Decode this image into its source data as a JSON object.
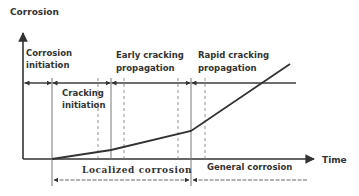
{
  "diagram": {
    "y_axis_label": "Corrosion",
    "x_axis_label": "Time",
    "stages": {
      "corrosion_initiation": [
        "Corrosion",
        "initiation"
      ],
      "cracking_initiation": [
        "Cracking",
        "initiation"
      ],
      "early_cracking_propagation": [
        "Early cracking",
        "propagation"
      ],
      "rapid_cracking_propagation": [
        "Rapid cracking",
        "propagation"
      ]
    },
    "regions": {
      "localized": "Localized corrosion",
      "general": "General corrosion"
    },
    "colors": {
      "line": "#333333",
      "guide": "#777777",
      "text": "#333333"
    }
  }
}
